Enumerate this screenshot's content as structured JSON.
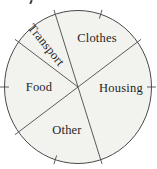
{
  "chart_data": {
    "type": "pie",
    "title": "",
    "slices": [
      {
        "label": "Clothes",
        "percent": 20
      },
      {
        "label": "Transport",
        "percent": 10
      },
      {
        "label": "Food",
        "percent": 20
      },
      {
        "label": "Other",
        "percent": 20
      },
      {
        "label": "Housing",
        "percent": 30
      }
    ],
    "start_angle_deg": 36,
    "direction": "counterclockwise",
    "tick_interval_percent": 10,
    "has_perimeter_ticks": true,
    "values_shown": false,
    "legend": "none",
    "colors": {
      "fill": "#f2f2ee",
      "stroke": "#4a4a4a",
      "label_text": "#1f1f1f"
    }
  }
}
